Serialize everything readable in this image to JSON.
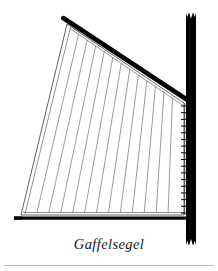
{
  "figure": {
    "caption": "Gaffelsegel",
    "title": "Gaffelsegel",
    "kind": "line-drawing",
    "background_color": "#ffffff",
    "ink_color": "#000000",
    "rule_color": "#b9bcc2",
    "sail_line_color": "#3a3a3a"
  },
  "chart_data": {
    "type": "diagram",
    "title": "Gaffelsegel",
    "xlabel": "",
    "ylabel": "",
    "parts": [
      {
        "name": "mast",
        "label": "mast",
        "shape": "vertical-bar",
        "color": "#000000",
        "x": 186,
        "y_top": 13,
        "y_bottom": 245,
        "width": 10,
        "notched_top": true,
        "notched_bottom": true
      },
      {
        "name": "gaff",
        "label": "gaff",
        "shape": "diagonal-spar",
        "color": "#000000",
        "x1": 62,
        "y1": 18,
        "x2": 189,
        "y2": 101,
        "thickness": 4.5
      },
      {
        "name": "boom",
        "label": "boom",
        "shape": "horizontal-bar",
        "color": "#000000",
        "x1": 14,
        "x2": 191,
        "y": 218,
        "thickness": 3
      },
      {
        "name": "sail",
        "label": "sail canvas",
        "shape": "quadrilateral",
        "outline_color": "#3a3a3a",
        "fill": "#ffffff",
        "corners": [
          {
            "name": "peak",
            "x": 67,
            "y": 24
          },
          {
            "name": "throat",
            "x": 184,
            "y": 103
          },
          {
            "name": "clew",
            "x": 184,
            "y": 215
          },
          {
            "name": "tack",
            "x": 21,
            "y": 215
          }
        ]
      }
    ],
    "seam_lines": {
      "label": "sail cloth seams",
      "count": 12,
      "color": "#4a4a4a",
      "top_x_start": 70,
      "top_x_end": 181,
      "bottom_x_start": 25,
      "bottom_x_end": 180
    },
    "mast_lacing": {
      "label": "mast hoops / lacing ticks",
      "count": 17,
      "color": "#000000",
      "x": 181,
      "y_start": 106,
      "y_end": 213,
      "length": 5
    }
  }
}
